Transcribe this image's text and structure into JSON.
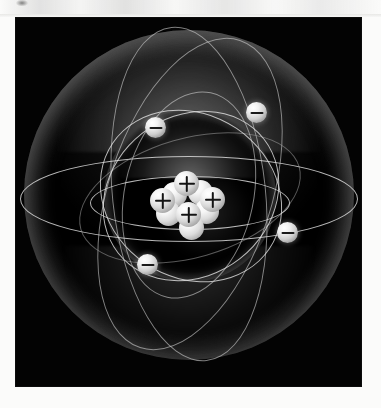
{
  "page": {
    "background_color": "#fbfbfa",
    "top_remnant_note": "faint clipped grey smudge at top edge of scanned page"
  },
  "panel": {
    "background_color": "#030303",
    "left": 16,
    "top": 18,
    "width": 345,
    "height": 368
  },
  "illustration": {
    "subject": "atom",
    "caption": "",
    "accent_color": "#e4e4e4",
    "shells": [
      {
        "name": "outer-electron-shell",
        "label": "outer shell sphere"
      },
      {
        "name": "inner-electron-shell",
        "label": "inner shell sphere"
      }
    ],
    "orbits": [
      {
        "name": "equatorial-outer-orbit"
      },
      {
        "name": "equatorial-inner-orbit"
      },
      {
        "name": "vertical-orbit-1"
      },
      {
        "name": "vertical-orbit-2"
      },
      {
        "name": "inner-orbit-1"
      },
      {
        "name": "inner-orbit-2"
      },
      {
        "name": "inner-orbit-3"
      },
      {
        "name": "inner-orbit-4"
      }
    ],
    "electrons": [
      {
        "id": "electron-top-left",
        "charge": "−",
        "x": 139,
        "y": 109
      },
      {
        "id": "electron-top-right",
        "charge": "−",
        "x": 240,
        "y": 94
      },
      {
        "id": "electron-right",
        "charge": "−",
        "x": 271,
        "y": 214
      },
      {
        "id": "electron-bottom-left",
        "charge": "−",
        "x": 131,
        "y": 246
      }
    ],
    "nucleus": {
      "label": "nucleus",
      "proton_charge": "+",
      "neutron_charge": "",
      "particles": [
        {
          "id": "proton-top",
          "type": "proton",
          "x": 170,
          "y": 165
        },
        {
          "id": "proton-left",
          "type": "proton",
          "x": 146,
          "y": 182
        },
        {
          "id": "proton-right",
          "type": "proton",
          "x": 196,
          "y": 181
        },
        {
          "id": "proton-center",
          "type": "proton",
          "x": 172,
          "y": 196
        },
        {
          "id": "neutron-mid-left",
          "type": "neutron",
          "x": 158,
          "y": 176
        },
        {
          "id": "neutron-mid-right",
          "type": "neutron",
          "x": 184,
          "y": 174
        },
        {
          "id": "neutron-low-left",
          "type": "neutron",
          "x": 152,
          "y": 195
        },
        {
          "id": "neutron-low-right",
          "type": "neutron",
          "x": 190,
          "y": 193
        },
        {
          "id": "neutron-bottom",
          "type": "neutron",
          "x": 175,
          "y": 209
        }
      ]
    }
  }
}
